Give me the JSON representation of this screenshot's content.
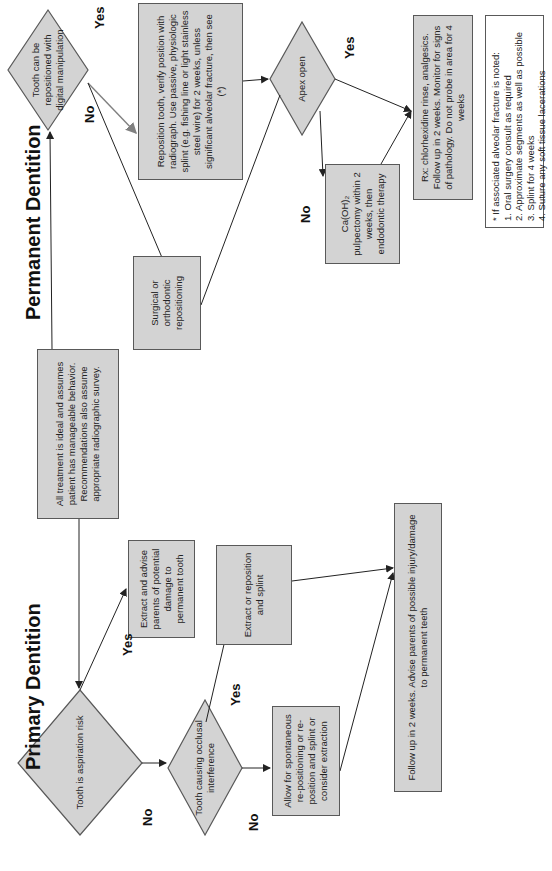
{
  "orientation": "rotated-90-ccw",
  "sections": {
    "primary_title": "Primary Dentition",
    "permanent_title": "Permanent Dentition"
  },
  "intro_box": "All treatment is ideal and assumes patient has manageable behavior. Recommendations also assume appropriate radiographic survey.",
  "primary": {
    "aspiration_decision": "Tooth is aspiration risk",
    "extract_advise": "Extract and advise parents of potential damage to permanent tooth",
    "occlusal_decision": "Tooth causing occlusal interference",
    "extract_reposition": "Extract or reposition and splint",
    "allow_spontaneous": "Allow for spontaneous re-positioning or re-position and splint or consider extraction",
    "follow_up": "Follow up in 2 weeks. Advise parents of possible injury/damage to permanent teeth"
  },
  "permanent": {
    "digital_decision": "Tooth can be repositioned with digital manipulation",
    "reposition": "Reposition tooth, verify position with radiograph. Use passive, physiologic splint (e.g. fishing line or light stainless steel wire) for 2 weeks, unless significant alveolar fracture, then see (*)",
    "surgical": "Surgical or orthodontic repositioning",
    "apex_decision": "Apex open",
    "pulpectomy": "Ca(OH)₂ pulpectomy within 2 weeks, then endodontic therapy",
    "rx": "Rx: chlorhexidine rinse, analgesics. Follow up in 2 weeks. Monitor for signs of pathology. Do not probe in area for 4 weeks"
  },
  "labels": {
    "yes": "Yes",
    "no": "No"
  },
  "footnote": {
    "heading": "* If associated alveolar fracture is noted:",
    "items": [
      "1. Oral surgery consult as required",
      "2. Approximate segments as well as possible",
      "3. Splint for 4 weeks",
      "4. Suture any soft tissue lacerations"
    ]
  },
  "colors": {
    "box_fill": "#d3d3d3",
    "box_border": "#595959",
    "line": "#222222",
    "highlight_arrow": "#808080"
  }
}
